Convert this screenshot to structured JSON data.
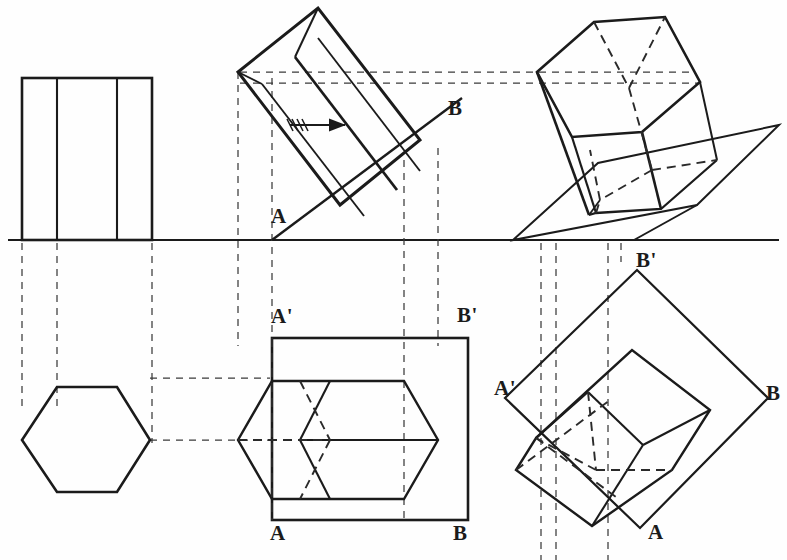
{
  "drawing": {
    "title": "Hexagonal prism resting on an inclined plane — orthographic and pictorial projection",
    "line_color": "#1b1b1b",
    "hidden_line_color": "#2a2a2a",
    "projector_color": "#3a3a3a",
    "background": "#fefefe",
    "ground_line_y": 240
  },
  "labels": {
    "elevation_A": "A",
    "elevation_B": "B",
    "plan_A_prime": "A'",
    "plan_B_prime": "B'",
    "plan_A": "A",
    "plan_B": "B",
    "pictorial_plan_A_prime": "A'",
    "pictorial_plan_B_prime": "B'",
    "pictorial_plan_A": "A",
    "pictorial_plan_B": "B",
    "pictorial_elevation_B_prime": "B'"
  },
  "views": {
    "front_elevation": {
      "name": "front-elevation-upright-prism",
      "description": "Rectangle with two internal vertical edges, standing on the ground line"
    },
    "tilted_elevation": {
      "name": "tilted-elevation-prism",
      "description": "Prism tilted about point A on the inclined line A-B"
    },
    "pictorial_elevation": {
      "name": "pictorial-elevation-prism",
      "description": "Isometric pictorial of the tilted hexagonal prism on an inclined plane"
    },
    "hexagon_plan": {
      "name": "plan-hexagon",
      "description": "True-shape hexagonal plan of the upright prism"
    },
    "tilted_plan": {
      "name": "plan-tilted-prism",
      "description": "Plan of the tilted prism inside rectangle A' B' B A"
    },
    "rotated_plan": {
      "name": "rotated-plan-prism",
      "description": "Plan of the prism rotated so A'B' lies at 45 degrees"
    }
  },
  "annotations": {
    "rotation_arrow": "rotation-direction-arrow"
  },
  "label_positions": {
    "elevation_A": {
      "x": 271,
      "y": 206
    },
    "elevation_B": {
      "x": 448,
      "y": 98
    },
    "plan_A_prime": {
      "x": 271,
      "y": 306
    },
    "plan_B_prime": {
      "x": 457,
      "y": 305
    },
    "plan_A": {
      "x": 270,
      "y": 523
    },
    "plan_B": {
      "x": 453,
      "y": 523
    },
    "pictorial_elevation_B_prime": {
      "x": 641,
      "y": 250
    },
    "pictorial_plan_A_prime": {
      "x": 496,
      "y": 378
    },
    "pictorial_plan_B_prime": {
      "x": 636,
      "y": 253
    },
    "pictorial_plan_A": {
      "x": 648,
      "y": 523
    },
    "pictorial_plan_B": {
      "x": 766,
      "y": 383
    }
  }
}
